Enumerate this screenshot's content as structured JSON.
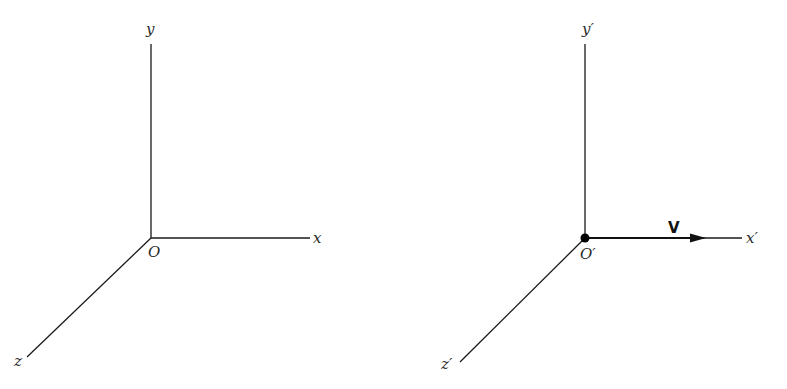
{
  "frames": {
    "stationary": {
      "origin_label": "O",
      "x_label": "x",
      "y_label": "y",
      "z_label": "z"
    },
    "moving": {
      "origin_label": "O′",
      "x_label": "x′",
      "y_label": "y′",
      "z_label": "z′",
      "velocity_label": "V",
      "origin_marker": "filled-dot",
      "velocity_direction": "+x′"
    }
  },
  "colors": {
    "line": "#1a1a1a",
    "background": "#ffffff"
  }
}
